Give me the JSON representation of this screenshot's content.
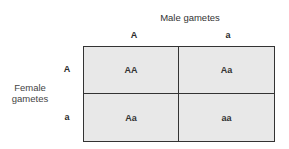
{
  "diagram": {
    "title": "Male gametes",
    "side_label_line1": "Female",
    "side_label_line2": "gametes",
    "columns": [
      "A",
      "a"
    ],
    "rows": [
      "A",
      "a"
    ],
    "cells": [
      [
        "AA",
        "Aa"
      ],
      [
        "Aa",
        "aa"
      ]
    ]
  }
}
